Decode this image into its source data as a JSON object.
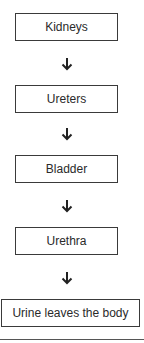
{
  "diagram": {
    "type": "flowchart",
    "direction": "top-to-bottom",
    "steps": [
      {
        "label": "Kidneys"
      },
      {
        "label": "Ureters"
      },
      {
        "label": "Bladder"
      },
      {
        "label": "Urethra"
      },
      {
        "label": "Urine leaves the body"
      }
    ],
    "connector_icon": "arrow-down-icon",
    "colors": {
      "border": "#3a3a3a",
      "text": "#2a2a2a",
      "background": "#ffffff"
    }
  }
}
